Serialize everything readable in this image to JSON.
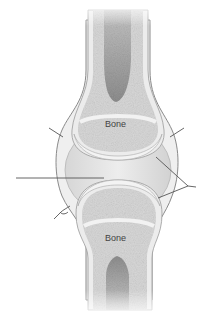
{
  "diagram": {
    "labels": {
      "upper_bone": "Bone",
      "lower_bone": "Bone"
    },
    "leader_lines": [
      {
        "id": "left-upper",
        "target": "articular-capsule-left"
      },
      {
        "id": "right-upper",
        "target": "articular-capsule-right"
      },
      {
        "id": "left-middle",
        "target": "joint-cavity"
      },
      {
        "id": "right-bracket",
        "target": "articular-cartilage"
      },
      {
        "id": "left-lower",
        "target": "synovial-membrane"
      }
    ],
    "colors": {
      "background": "#ffffff",
      "bone_spongy": "#d9d9d9",
      "bone_cortex": "#ececec",
      "marrow_cavity": "#9a9a9a",
      "cartilage": "#f0f0f0",
      "joint_cavity": "#e2e2e2",
      "capsule_outline": "#8a8a8a",
      "leader_line": "#555555",
      "label_text": "#444444"
    }
  }
}
